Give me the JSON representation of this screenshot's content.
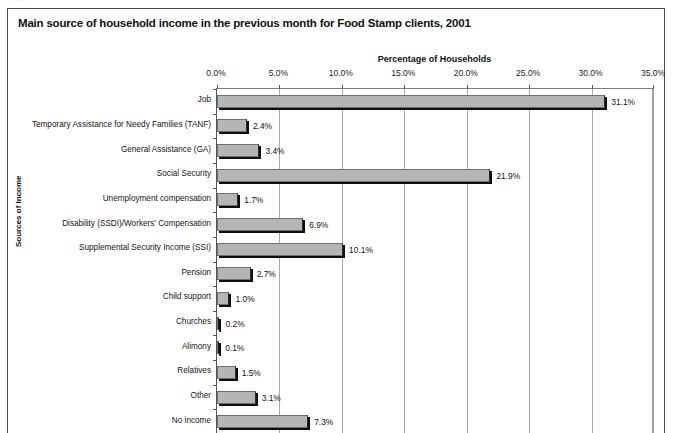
{
  "page_remnant": "· · · ·",
  "chart_title": "Main source of household income in the previous month for Food Stamp clients, 2001",
  "axes": {
    "x_title": "Percentage of Households",
    "y_title": "Sources of Income"
  },
  "chart_data": {
    "type": "bar",
    "orientation": "horizontal",
    "title": "Main source of household income in the previous month for Food Stamp clients, 2001",
    "xlabel": "Percentage of Households",
    "ylabel": "Sources of Income",
    "xlim": [
      0,
      35
    ],
    "xtick_labels": [
      "0.0%",
      "5.0%",
      "10.0%",
      "15.0%",
      "20.0%",
      "25.0%",
      "30.0%",
      "35.0%"
    ],
    "xticks": [
      0,
      5,
      10,
      15,
      20,
      25,
      30,
      35
    ],
    "grid": true,
    "legend": "none",
    "categories": [
      "Job",
      "Temporary Assistance for Needy Families (TANF)",
      "General Assistance (GA)",
      "Social Security",
      "Unemployment compensation",
      "Disability (SSDI)/Workers' Compensation",
      "Supplemental Security Income (SSI)",
      "Pension",
      "Child support",
      "Churches",
      "Alimony",
      "Relatives",
      "Other",
      "No income"
    ],
    "values": [
      31.1,
      2.4,
      3.4,
      21.9,
      1.7,
      6.9,
      10.1,
      2.7,
      1.0,
      0.2,
      0.1,
      1.5,
      3.1,
      7.3
    ],
    "value_labels": [
      "31.1%",
      "2.4%",
      "3.4%",
      "21.9%",
      "1.7%",
      "6.9%",
      "10.1%",
      "2.7%",
      "1.0%",
      "0.2%",
      "0.1%",
      "1.5%",
      "3.1%",
      "7.3%"
    ],
    "colors": {
      "bar_fill": "#b5b5b5",
      "bar_shadow": "#0d0d0d",
      "bar_outline": "#6e6e6e",
      "gridline": "#a8a8a8",
      "text": "#111111",
      "frame": "#4a4a4a"
    }
  }
}
